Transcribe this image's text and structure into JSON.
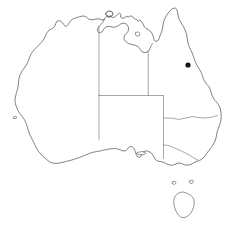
{
  "map": {
    "title": "Australia outline map",
    "region_name": "Australia",
    "background_color": "#ffffff",
    "coastline_color": "#4a4a4a",
    "border_color": "#6d6d6d",
    "marker_color": "#141414",
    "canvas": {
      "width": 241,
      "height": 226
    },
    "features": {
      "mainland_label": "Australian mainland",
      "tasmania_label": "Tasmania",
      "kangaroo_island_label": "Kangaroo Island",
      "groote_eylandt_label": "Groote Eylandt",
      "melville_island_label": "Melville Island",
      "king_island_label": "King Island",
      "flinders_island_label": "Flinders Island",
      "rottnest_island_label": "Rottnest Island"
    },
    "state_borders": [
      {
        "name": "wa-nt-sa-western-meridian",
        "label": "Western Australia eastern border"
      },
      {
        "name": "nt-qld-meridian",
        "label": "Northern Territory / Queensland border"
      },
      {
        "name": "nt-sa-parallel",
        "label": "Northern Territory / South Australia border"
      },
      {
        "name": "sa-nsw-qld-eastern",
        "label": "South Australia eastern border"
      },
      {
        "name": "qld-nsw-parallel",
        "label": "Queensland / New South Wales border"
      },
      {
        "name": "nsw-vic-murray",
        "label": "New South Wales / Victoria border"
      }
    ],
    "markers": [
      {
        "name": "east-coast-point",
        "label": "",
        "x": 188,
        "y": 65,
        "radius": 2.6,
        "color": "#141414"
      }
    ]
  }
}
